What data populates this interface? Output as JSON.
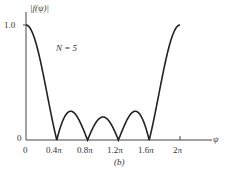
{
  "chart_data": {
    "type": "line",
    "title": "",
    "ylabel": "|f(ψ)|",
    "xlabel": "ψ",
    "annotation": "N = 5",
    "caption": "(b)",
    "x_ticks": [
      "0",
      "0.4π",
      "0.8π",
      "1.2π",
      "1.6π",
      "2π"
    ],
    "x_tick_values": [
      0,
      0.4,
      0.8,
      1.2,
      1.6,
      2.0
    ],
    "y_ticks": [
      "0",
      "1.0"
    ],
    "y_tick_values": [
      0,
      1.0
    ],
    "xlim": [
      0,
      2.2
    ],
    "ylim": [
      0,
      1.0
    ],
    "grid": false,
    "legend": null,
    "series": [
      {
        "name": "|f(ψ)|, N = 5",
        "description": "|sin(Nψ/2) / (N sin(ψ/2))| for N = 5, ψ in units of π",
        "x": [
          0,
          0.1,
          0.2,
          0.3,
          0.4,
          0.5,
          0.6,
          0.7,
          0.8,
          0.9,
          1.0,
          1.1,
          1.2,
          1.3,
          1.4,
          1.5,
          1.6,
          1.7,
          1.8,
          1.9,
          2.0
        ],
        "y": [
          1.0,
          0.85,
          0.65,
          0.32,
          0.0,
          0.2,
          0.25,
          0.18,
          0.0,
          0.2,
          0.2,
          0.2,
          0.0,
          0.18,
          0.25,
          0.2,
          0.0,
          0.32,
          0.65,
          0.85,
          1.0
        ]
      }
    ]
  },
  "labels": {
    "y_axis": "|f(ψ)|",
    "y_tick_top": "1.0",
    "y_tick_zero": "0",
    "x_axis": "ψ",
    "n_label": "N = 5",
    "caption": "(b)",
    "x_ticks": [
      "0",
      "0.4π",
      "0.8π",
      "1.2π",
      "1.6π",
      "2π"
    ]
  }
}
